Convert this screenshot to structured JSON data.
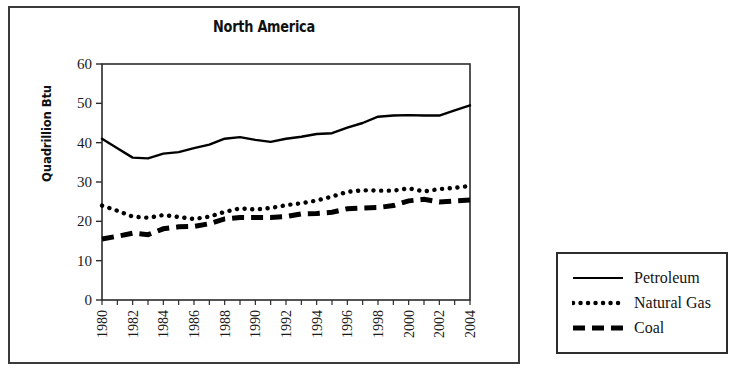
{
  "chart_data": {
    "type": "line",
    "title": "North America",
    "xlabel": "",
    "ylabel": "Quadrillion Btu",
    "ylim": [
      0,
      60
    ],
    "yticks": [
      0,
      10,
      20,
      30,
      40,
      50,
      60
    ],
    "xlim": [
      1980,
      2004
    ],
    "x": [
      1980,
      1981,
      1982,
      1983,
      1984,
      1985,
      1986,
      1987,
      1988,
      1989,
      1990,
      1991,
      1992,
      1993,
      1994,
      1995,
      1996,
      1997,
      1998,
      1999,
      2000,
      2001,
      2002,
      2003,
      2004
    ],
    "xtick_labels": [
      "1980",
      "1982",
      "1984",
      "1986",
      "1988",
      "1990",
      "1992",
      "1994",
      "1996",
      "1998",
      "2000",
      "2002",
      "2004"
    ],
    "xtick_values": [
      1980,
      1982,
      1984,
      1986,
      1988,
      1990,
      1992,
      1994,
      1996,
      1998,
      2000,
      2002,
      2004
    ],
    "grid": false,
    "legend_position": "outside-right-bottom",
    "series": [
      {
        "name": "Petroleum",
        "style": "solid",
        "color": "#000000",
        "values": [
          41.0,
          38.6,
          36.2,
          36.0,
          37.2,
          37.6,
          38.6,
          39.5,
          41.0,
          41.4,
          40.7,
          40.2,
          41.0,
          41.5,
          42.2,
          42.4,
          43.8,
          45.0,
          46.6,
          46.9,
          47.0,
          46.9,
          46.9,
          48.2,
          49.5
        ]
      },
      {
        "name": "Natural Gas",
        "style": "dotted",
        "color": "#000000",
        "values": [
          24.0,
          22.7,
          21.2,
          20.9,
          21.6,
          21.1,
          20.6,
          21.2,
          22.4,
          23.3,
          23.0,
          23.4,
          24.1,
          24.6,
          25.3,
          26.3,
          27.5,
          27.9,
          27.8,
          27.8,
          28.4,
          27.6,
          28.2,
          28.5,
          29.0
        ]
      },
      {
        "name": "Coal",
        "style": "dashed",
        "color": "#000000",
        "values": [
          15.5,
          16.2,
          17.0,
          16.6,
          18.1,
          18.6,
          18.7,
          19.4,
          20.6,
          21.0,
          21.0,
          21.0,
          21.2,
          21.9,
          22.0,
          22.3,
          23.2,
          23.4,
          23.5,
          24.0,
          25.2,
          25.6,
          24.9,
          25.2,
          25.4
        ]
      }
    ]
  },
  "legend": {
    "items": [
      {
        "label": "Petroleum",
        "style": "solid"
      },
      {
        "label": "Natural Gas",
        "style": "dotted"
      },
      {
        "label": "Coal",
        "style": "dashed"
      }
    ]
  }
}
